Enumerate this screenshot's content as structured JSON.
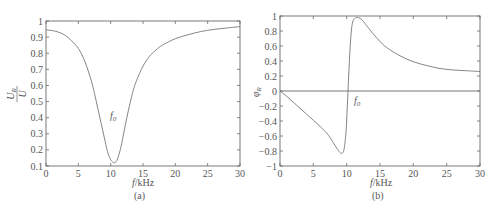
{
  "chart_data": [
    {
      "id": "a",
      "type": "line",
      "panel_label": "(a)",
      "title": "",
      "xlabel": "f/kHz",
      "ylabel": "U_R / U",
      "ylabel_num": "U_R",
      "ylabel_den": "U",
      "xlim": [
        0,
        30
      ],
      "ylim": [
        0.1,
        1
      ],
      "xticks": [
        0,
        5,
        10,
        15,
        20,
        25,
        30
      ],
      "yticks": [
        0.1,
        0.2,
        0.3,
        0.4,
        0.5,
        0.6,
        0.7,
        0.8,
        0.9,
        1
      ],
      "ytick_labels": [
        "0.1",
        "0.2",
        "0.3",
        "0.4",
        "0.5",
        "0.6",
        "0.7",
        "0.8",
        "0.9",
        "1"
      ],
      "grid": false,
      "annotation": {
        "text": "f0",
        "x": 10.3,
        "y": 0.3
      },
      "series": [
        {
          "name": "U_R/U",
          "x": [
            0,
            1,
            2,
            3,
            4,
            5,
            6,
            7,
            7.5,
            8,
            8.5,
            9,
            9.5,
            10,
            10.3,
            10.6,
            10.9,
            11.2,
            11.6,
            12,
            12.5,
            13,
            13.5,
            14,
            15,
            16,
            17,
            18,
            20,
            22,
            24,
            26,
            28,
            30
          ],
          "values": [
            0.945,
            0.94,
            0.93,
            0.91,
            0.875,
            0.83,
            0.75,
            0.63,
            0.55,
            0.46,
            0.37,
            0.28,
            0.19,
            0.14,
            0.125,
            0.12,
            0.13,
            0.16,
            0.22,
            0.3,
            0.4,
            0.49,
            0.57,
            0.63,
            0.72,
            0.78,
            0.82,
            0.85,
            0.89,
            0.915,
            0.935,
            0.948,
            0.957,
            0.965
          ]
        }
      ]
    },
    {
      "id": "b",
      "type": "line",
      "panel_label": "(b)",
      "title": "",
      "xlabel": "f/kHz",
      "ylabel": "φR",
      "xlim": [
        0,
        30
      ],
      "ylim": [
        -1,
        1
      ],
      "xticks": [
        0,
        5,
        10,
        15,
        20,
        25,
        30
      ],
      "yticks": [
        -1,
        -0.8,
        -0.6,
        -0.4,
        -0.2,
        0,
        0.2,
        0.4,
        0.6,
        0.8,
        1
      ],
      "ytick_labels": [
        "−1",
        "−0.8",
        "−0.6",
        "−0.4",
        "−0.2",
        "0",
        "0.2",
        "0.4",
        "0.6",
        "0.8",
        "1"
      ],
      "grid": false,
      "zero_line": true,
      "annotation": {
        "text": "f0",
        "x": 11.0,
        "y": -0.1
      },
      "series": [
        {
          "name": "φR",
          "x": [
            0,
            1,
            2,
            3,
            4,
            5,
            6,
            7,
            7.5,
            8,
            8.5,
            9,
            9.3,
            9.6,
            9.9,
            10.1,
            10.3,
            10.5,
            10.7,
            10.9,
            11.2,
            11.6,
            12,
            12.5,
            13,
            14,
            15,
            16,
            18,
            20,
            22,
            24,
            26,
            28,
            30
          ],
          "values": [
            0,
            -0.07,
            -0.15,
            -0.23,
            -0.31,
            -0.39,
            -0.47,
            -0.56,
            -0.62,
            -0.69,
            -0.76,
            -0.82,
            -0.83,
            -0.78,
            -0.55,
            -0.2,
            0.2,
            0.55,
            0.8,
            0.92,
            0.97,
            0.98,
            0.97,
            0.93,
            0.87,
            0.76,
            0.66,
            0.58,
            0.47,
            0.39,
            0.34,
            0.3,
            0.28,
            0.27,
            0.26
          ]
        }
      ]
    }
  ],
  "labels": {
    "a_xlabel_italic": "f",
    "a_xlabel_rest": "/kHz",
    "b_xlabel_italic": "f",
    "b_xlabel_rest": "/kHz",
    "a_panel": "(a)",
    "b_panel": "(b)",
    "a_ylabel_num": "U",
    "a_ylabel_num_sub": "R",
    "a_ylabel_den": "U",
    "b_ylabel_main": "φ",
    "b_ylabel_sub": "R",
    "f0_main": "f",
    "f0_sub": "0"
  }
}
